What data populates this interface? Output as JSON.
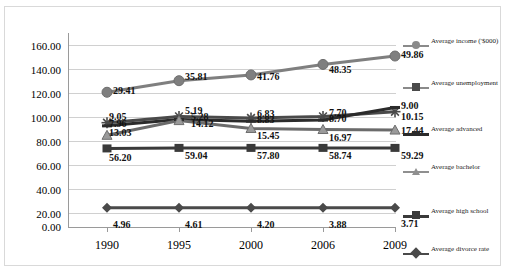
{
  "chart_data": {
    "type": "line",
    "title": "",
    "xlabel": "",
    "ylabel": "",
    "ylim": [
      0,
      160
    ],
    "ytick_step": 20,
    "grid": true,
    "legend_position": "right",
    "categories": [
      "1990",
      "1995",
      "2000",
      "2006",
      "2009"
    ],
    "ytick_labels": [
      "160.00",
      "140.00",
      "120.00",
      "100.00",
      "80.00",
      "60.00",
      "40.00",
      "20.00",
      "0.00"
    ],
    "series": [
      {
        "name": "Average income ('$000)",
        "marker": "circle",
        "color": "#7f7f7f",
        "values": [
          115.0,
          126.0,
          131.5,
          141.5,
          149.5
        ],
        "labels": [
          "29.41",
          "35.81",
          "41.76",
          "48.35",
          "49.86"
        ]
      },
      {
        "name": "Average unemployment",
        "marker": "asterisk",
        "color": "#4a4a4a",
        "values": [
          86.0,
          92.0,
          90.5,
          92.0,
          96.5
        ],
        "labels": [
          "9.05",
          "5.19",
          "6.83",
          "7.70",
          "9.00"
        ]
      },
      {
        "name": "Average advanced",
        "marker": "dash",
        "color": "#2b2b2b",
        "values": [
          83.0,
          89.0,
          87.5,
          88.5,
          100.5
        ],
        "labels": [
          "7.96",
          "5.28",
          "8.83",
          "8.70",
          "10.15"
        ]
      },
      {
        "name": "Average bachelor",
        "marker": "triangle",
        "color": "#6b6b6b",
        "values": [
          74.0,
          88.0,
          80.5,
          79.5,
          79.0
        ],
        "labels": [
          "13.03",
          "14.12",
          "15.45",
          "16.97",
          "17.44"
        ]
      },
      {
        "name": "Average high school",
        "marker": "square",
        "color": "#3a3a3a",
        "values": [
          61.5,
          62.0,
          62.0,
          62.0,
          62.0
        ],
        "labels": [
          "56.20",
          "59.04",
          "57.80",
          "58.74",
          "59.29"
        ]
      },
      {
        "name": "Average divorce rate",
        "marker": "diamond",
        "color": "#4a4a4a",
        "values": [
          5.0,
          5.0,
          5.0,
          5.0,
          5.0
        ],
        "labels": [
          "4.96",
          "4.61",
          "4.20",
          "3.88",
          "3.71"
        ]
      }
    ]
  },
  "legend": {
    "items": [
      {
        "label": "Average income ('$000)"
      },
      {
        "label": "Average unemployment"
      },
      {
        "label": "Average advanced"
      },
      {
        "label": "Average bachelor"
      },
      {
        "label": "Average high school"
      },
      {
        "label": "Average divorce rate"
      }
    ]
  }
}
